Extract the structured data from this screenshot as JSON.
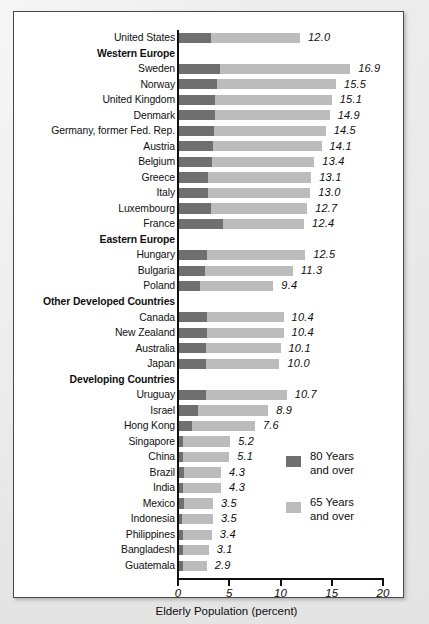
{
  "figure": {
    "axis_title": "Elderly Population (percent)",
    "x_ticks": [
      "0",
      "5",
      "10",
      "15",
      "20"
    ]
  },
  "legend": {
    "items": [
      {
        "name": "legend-80-plus",
        "line1": "80 Years",
        "line2": "and over",
        "color": "#6f6f6f"
      },
      {
        "name": "legend-65-plus",
        "line1": "65 Years",
        "line2": "and over",
        "color": "#bcbcbc"
      }
    ]
  },
  "chart_data": {
    "type": "bar",
    "orientation": "horizontal",
    "stacked": true,
    "title": "",
    "xlabel": "Elderly Population (percent)",
    "ylabel": "",
    "xlim": [
      0,
      20
    ],
    "xticks": [
      0,
      5,
      10,
      15,
      20
    ],
    "grid": false,
    "legend_position": "right-bottom",
    "series": [
      {
        "name": "80 Years and over",
        "color": "#6f6f6f"
      },
      {
        "name": "65 Years and over",
        "color": "#bcbcbc"
      }
    ],
    "rows": [
      {
        "label": "United States",
        "type": "bar",
        "value": 12.0,
        "value_label": "12.0",
        "v80": 3.3
      },
      {
        "label": "Western Europe",
        "type": "group"
      },
      {
        "label": "Sweden",
        "type": "bar",
        "value": 16.9,
        "value_label": "16.9",
        "v80": 4.2
      },
      {
        "label": "Norway",
        "type": "bar",
        "value": 15.5,
        "value_label": "15.5",
        "v80": 3.9
      },
      {
        "label": "United Kingdom",
        "type": "bar",
        "value": 15.1,
        "value_label": "15.1",
        "v80": 3.7
      },
      {
        "label": "Denmark",
        "type": "bar",
        "value": 14.9,
        "value_label": "14.9",
        "v80": 3.7
      },
      {
        "label": "Germany, former Fed. Rep.",
        "type": "bar",
        "value": 14.5,
        "value_label": "14.5",
        "v80": 3.6
      },
      {
        "label": "Austria",
        "type": "bar",
        "value": 14.1,
        "value_label": "14.1",
        "v80": 3.5
      },
      {
        "label": "Belgium",
        "type": "bar",
        "value": 13.4,
        "value_label": "13.4",
        "v80": 3.4
      },
      {
        "label": "Greece",
        "type": "bar",
        "value": 13.1,
        "value_label": "13.1",
        "v80": 3.0
      },
      {
        "label": "Italy",
        "type": "bar",
        "value": 13.0,
        "value_label": "13.0",
        "v80": 3.0
      },
      {
        "label": "Luxembourg",
        "type": "bar",
        "value": 12.7,
        "value_label": "12.7",
        "v80": 3.3
      },
      {
        "label": "France",
        "type": "bar",
        "value": 12.4,
        "value_label": "12.4",
        "v80": 4.5
      },
      {
        "label": "Eastern Europe",
        "type": "group"
      },
      {
        "label": "Hungary",
        "type": "bar",
        "value": 12.5,
        "value_label": "12.5",
        "v80": 2.9
      },
      {
        "label": "Bulgaria",
        "type": "bar",
        "value": 11.3,
        "value_label": "11.3",
        "v80": 2.7
      },
      {
        "label": "Poland",
        "type": "bar",
        "value": 9.4,
        "value_label": "9.4",
        "v80": 2.2
      },
      {
        "label": "Other Developed Countries",
        "type": "group"
      },
      {
        "label": "Canada",
        "type": "bar",
        "value": 10.4,
        "value_label": "10.4",
        "v80": 2.9
      },
      {
        "label": "New Zealand",
        "type": "bar",
        "value": 10.4,
        "value_label": "10.4",
        "v80": 2.9
      },
      {
        "label": "Australia",
        "type": "bar",
        "value": 10.1,
        "value_label": "10.1",
        "v80": 2.8
      },
      {
        "label": "Japan",
        "type": "bar",
        "value": 10.0,
        "value_label": "10.0",
        "v80": 2.8
      },
      {
        "label": "Developing Countries",
        "type": "group"
      },
      {
        "label": "Uruguay",
        "type": "bar",
        "value": 10.7,
        "value_label": "10.7",
        "v80": 2.8
      },
      {
        "label": "Israel",
        "type": "bar",
        "value": 8.9,
        "value_label": "8.9",
        "v80": 2.0
      },
      {
        "label": "Hong Kong",
        "type": "bar",
        "value": 7.6,
        "value_label": "7.6",
        "v80": 1.5
      },
      {
        "label": "Singapore",
        "type": "bar",
        "value": 5.2,
        "value_label": "5.2",
        "v80": 0.6
      },
      {
        "label": "China",
        "type": "bar",
        "value": 5.1,
        "value_label": "5.1",
        "v80": 0.6
      },
      {
        "label": "Brazil",
        "type": "bar",
        "value": 4.3,
        "value_label": "4.3",
        "v80": 0.7
      },
      {
        "label": "India",
        "type": "bar",
        "value": 4.3,
        "value_label": "4.3",
        "v80": 0.6
      },
      {
        "label": "Mexico",
        "type": "bar",
        "value": 3.5,
        "value_label": "3.5",
        "v80": 0.7
      },
      {
        "label": "Indonesia",
        "type": "bar",
        "value": 3.5,
        "value_label": "3.5",
        "v80": 0.5
      },
      {
        "label": "Philippines",
        "type": "bar",
        "value": 3.4,
        "value_label": "3.4",
        "v80": 0.6
      },
      {
        "label": "Bangladesh",
        "type": "bar",
        "value": 3.1,
        "value_label": "3.1",
        "v80": 0.6
      },
      {
        "label": "Guatemala",
        "type": "bar",
        "value": 2.9,
        "value_label": "2.9",
        "v80": 0.6
      }
    ]
  }
}
